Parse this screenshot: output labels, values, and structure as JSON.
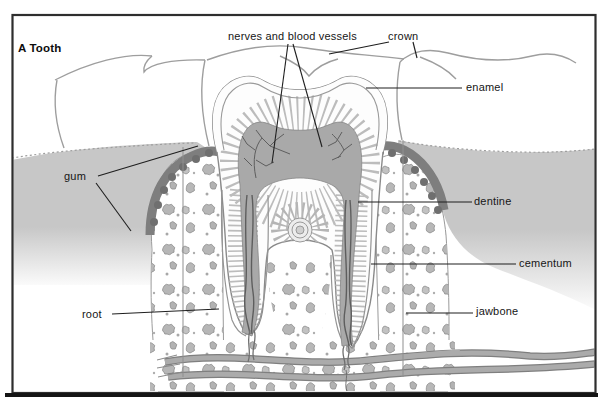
{
  "figure": {
    "title": "A Tooth",
    "type": "labeled cross-section diagram of a molar tooth in the jaw",
    "labels": {
      "nerves_and_blood_vessels": "nerves and blood vessels",
      "crown": "crown",
      "enamel": "enamel",
      "gum": "gum",
      "dentine": "dentine",
      "cementum": "cementum",
      "root": "root",
      "jawbone": "jawbone"
    },
    "colors": {
      "background": "#ffffff",
      "frame_border": "#2e2e2e",
      "frame_bottom_shadow": "#151515",
      "label_text": "#161616",
      "leader_line": "#1f1f1f",
      "illustration_outline": "#8a8a8a",
      "gum_fill": "#c7c7c7",
      "gum_band": "#7e7e7e",
      "gum_band_scallop": "#6f6f6f",
      "pulp_fill": "#a9a9a9",
      "pulp_vessels": "#5e5e5e",
      "dentine_striation": "#bcbcbc",
      "trabecula_fill": "#b6b6b6",
      "trabecula_outline": "#878787",
      "blood_vessel": "#ababab"
    }
  }
}
